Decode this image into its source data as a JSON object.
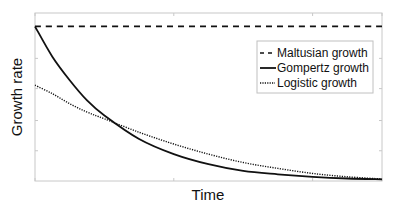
{
  "chart_data": {
    "type": "line",
    "title": "",
    "xlabel": "Time",
    "ylabel": "Growth rate",
    "xlim": [
      0,
      1
    ],
    "ylim": [
      0,
      1
    ],
    "grid": false,
    "tick_labels_shown": false,
    "legend_position": "upper right",
    "x_ticks": [
      0,
      0.4,
      0.8,
      1.0
    ],
    "y_ticks": [
      0.18,
      0.36,
      0.55,
      0.73,
      0.92
    ],
    "series": [
      {
        "name": "Maltusian growth",
        "style": "dashed",
        "x": [
          0,
          0.25,
          0.5,
          0.75,
          1.0
        ],
        "y": [
          0.92,
          0.92,
          0.92,
          0.92,
          0.92
        ]
      },
      {
        "name": "Gompertz growth",
        "style": "solid",
        "x": [
          0,
          0.05,
          0.1,
          0.15,
          0.2,
          0.3,
          0.4,
          0.5,
          0.6,
          0.7,
          0.8,
          0.9,
          1.0
        ],
        "y": [
          0.92,
          0.74,
          0.6,
          0.48,
          0.39,
          0.25,
          0.16,
          0.1,
          0.06,
          0.04,
          0.025,
          0.015,
          0.01
        ]
      },
      {
        "name": "Logistic growth",
        "style": "dotted",
        "x": [
          0,
          0.05,
          0.1,
          0.15,
          0.2,
          0.3,
          0.4,
          0.5,
          0.6,
          0.7,
          0.8,
          0.9,
          1.0
        ],
        "y": [
          0.57,
          0.52,
          0.46,
          0.41,
          0.37,
          0.29,
          0.22,
          0.16,
          0.11,
          0.075,
          0.045,
          0.025,
          0.012
        ]
      }
    ]
  },
  "legend": {
    "items": [
      {
        "label": "Maltusian growth",
        "style": "dashed"
      },
      {
        "label": "Gompertz growth",
        "style": "solid"
      },
      {
        "label": "Logistic growth",
        "style": "dotted"
      }
    ]
  },
  "colors": {
    "line": "#111111",
    "axes": "#c8c8c8",
    "legend_border": "#c0c0c0"
  }
}
